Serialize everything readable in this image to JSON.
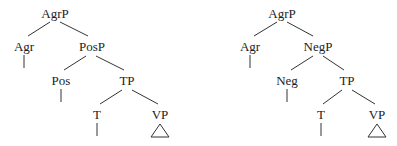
{
  "trees": [
    {
      "name": "left-tree",
      "nodes": {
        "root": "AgrP",
        "agr": "Agr",
        "mid": "PosP",
        "mid_head": "Pos",
        "tp": "TP",
        "t": "T",
        "vp": "VP"
      }
    },
    {
      "name": "right-tree",
      "nodes": {
        "root": "AgrP",
        "agr": "Agr",
        "mid": "NegP",
        "mid_head": "Neg",
        "tp": "TP",
        "t": "T",
        "vp": "VP"
      }
    }
  ],
  "colors": {
    "ink": "#222222",
    "background": "#ffffff"
  }
}
